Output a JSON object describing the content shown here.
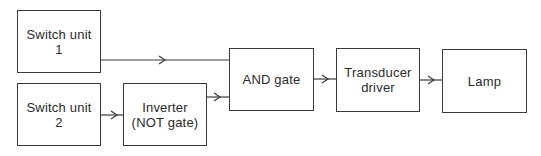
{
  "diagram": {
    "type": "block-diagram",
    "blocks": [
      {
        "id": "switch1",
        "lines": [
          "Switch unit",
          "1"
        ]
      },
      {
        "id": "switch2",
        "lines": [
          "Switch unit",
          "2"
        ]
      },
      {
        "id": "inverter",
        "lines": [
          "Inverter",
          "(NOT gate)"
        ]
      },
      {
        "id": "and",
        "lines": [
          "AND gate"
        ]
      },
      {
        "id": "driver",
        "lines": [
          "Transducer",
          "driver"
        ]
      },
      {
        "id": "lamp",
        "lines": [
          "Lamp"
        ]
      }
    ],
    "connections": [
      {
        "from": "switch1",
        "to": "and"
      },
      {
        "from": "switch2",
        "to": "inverter"
      },
      {
        "from": "inverter",
        "to": "and"
      },
      {
        "from": "and",
        "to": "driver"
      },
      {
        "from": "driver",
        "to": "lamp"
      }
    ],
    "colors": {
      "line": "#3a3a3a",
      "background": "#ffffff"
    }
  }
}
